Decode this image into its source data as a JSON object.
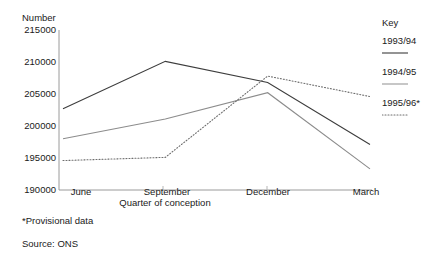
{
  "chart_data": {
    "type": "line",
    "title": "",
    "xlabel": "Quarter of conception",
    "ylabel": "Number",
    "categories": [
      "June",
      "September",
      "December",
      "March"
    ],
    "ylim": [
      190000,
      215000
    ],
    "yticks": [
      215000,
      210000,
      205000,
      200000,
      195000,
      190000
    ],
    "ytick_labels": [
      "215000",
      "210000",
      "205000",
      "200000",
      "195000",
      "190000"
    ],
    "grid": false,
    "legend_position": "right",
    "legend_title": "Key",
    "series": [
      {
        "name": "1993/94",
        "style": "solid",
        "color": "#3d3d3d",
        "values": [
          202700,
          210100,
          206800,
          197100
        ]
      },
      {
        "name": "1994/95",
        "style": "solid",
        "color": "#8c8c8c",
        "values": [
          198000,
          201100,
          205200,
          193300
        ]
      },
      {
        "name": "1995/96*",
        "style": "dotted",
        "color": "#6e6e6e",
        "values": [
          194600,
          195100,
          207800,
          204600
        ]
      }
    ],
    "annotations": [
      "*Provisional data",
      "Source: ONS"
    ]
  },
  "footnotes": {
    "provisional": "*Provisional data",
    "source": "Source: ONS"
  },
  "legend": {
    "title": "Key",
    "entries": [
      {
        "label": "1993/94"
      },
      {
        "label": "1994/95"
      },
      {
        "label": "1995/96*"
      }
    ]
  }
}
